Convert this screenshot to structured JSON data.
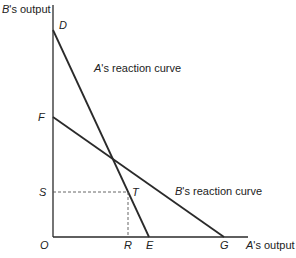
{
  "diagram": {
    "type": "reaction-curves",
    "axes": {
      "y_label_prefix": "B",
      "y_label_suffix": "'s output",
      "x_label_prefix": "A",
      "x_label_suffix": "'s output",
      "origin": "O"
    },
    "points": {
      "D": "D",
      "F": "F",
      "S": "S",
      "T": "T",
      "R": "R",
      "E": "E",
      "G": "G"
    },
    "curves": {
      "a_prefix": "A",
      "a_suffix": "'s reaction curve",
      "b_prefix": "B",
      "b_suffix": "'s reaction curve"
    },
    "colors": {
      "line": "#2a2a2a",
      "dashed": "#555555"
    }
  }
}
